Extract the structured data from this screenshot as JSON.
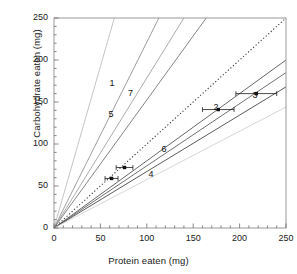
{
  "chart_data": {
    "type": "line",
    "title": "",
    "xlabel": "Protein eaten (mg)",
    "ylabel": "Carbohydrate eaten (mg)",
    "xlim": [
      0,
      250
    ],
    "ylim": [
      0,
      250
    ],
    "xticks": [
      0,
      50,
      100,
      150,
      200,
      250
    ],
    "yticks": [
      0,
      50,
      100,
      150,
      200,
      250
    ],
    "xtick_labels": [
      "0",
      "50",
      "100",
      "150",
      "200",
      "250"
    ],
    "ytick_labels": [
      "0",
      "50",
      "100",
      "150",
      "200",
      "250"
    ],
    "minor_tick_interval": 10,
    "grid": false,
    "legend": "none",
    "note": "Radial nutritional rails through the origin; each rail labelled 1-7. Dotted line is the 1:1 reference. Markers with horizontal error bars mark mean intake points.",
    "series": [
      {
        "name": "5",
        "label": "5",
        "slope": 3.85,
        "x_end": 65.0,
        "y_end": 250.0,
        "label_x": 62,
        "label_y": 135,
        "color": "#b9b9b9",
        "style": "solid",
        "point": null
      },
      {
        "name": "dotted-reference",
        "label": "",
        "slope": 1.0,
        "x_end": 250.0,
        "y_end": 250.0,
        "label_x": null,
        "label_y": null,
        "color": "#3a3a3a",
        "style": "dotted",
        "point": null
      },
      {
        "name": "6",
        "label": "6",
        "slope": 1.78,
        "x_end": 140.0,
        "y_end": 250.0,
        "label_x": 119,
        "label_y": 93,
        "color": "#9d9d9d",
        "style": "solid",
        "point": null
      },
      {
        "name": "7",
        "label": "7",
        "slope": 2.22,
        "x_end": 113.0,
        "y_end": 250.0,
        "label_x": 83,
        "label_y": 160,
        "color": "#8c8c8c",
        "style": "solid",
        "point": {
          "x": 76,
          "y": 72,
          "xerr": 9
        }
      },
      {
        "name": "1",
        "label": "1",
        "slope": 1.52,
        "x_end": 164.0,
        "y_end": 250.0,
        "label_x": 63,
        "label_y": 172,
        "color": "#6f6f6f",
        "style": "solid",
        "point": {
          "x": 62,
          "y": 59,
          "xerr": 7
        }
      },
      {
        "name": "2",
        "label": "2",
        "slope": 0.8,
        "x_end": 250.0,
        "y_end": 200.0,
        "label_x": 175,
        "label_y": 143,
        "color": "#4c4c4c",
        "style": "solid",
        "point": {
          "x": 177,
          "y": 141,
          "xerr": 17
        }
      },
      {
        "name": "3",
        "label": "3",
        "slope": 0.74,
        "x_end": 250.0,
        "y_end": 185.0,
        "label_x": 217,
        "label_y": 157,
        "color": "#565656",
        "style": "solid",
        "point": {
          "x": 218,
          "y": 160,
          "xerr": 22
        }
      },
      {
        "name": "4",
        "label": "4",
        "slope": 0.67,
        "x_end": 250.0,
        "y_end": 168.0,
        "label_x": 105,
        "label_y": 63,
        "color": "#3d3d3d",
        "style": "solid",
        "point": null
      },
      {
        "name": "lowest-rail",
        "label": "",
        "slope": 0.575,
        "x_end": 250.0,
        "y_end": 144.0,
        "label_x": null,
        "label_y": null,
        "color": "#cfcfcf",
        "style": "solid",
        "point": null
      }
    ]
  },
  "axes": {
    "frame_color": "#8f8f8f",
    "tick_color": "#6a6a6a"
  }
}
